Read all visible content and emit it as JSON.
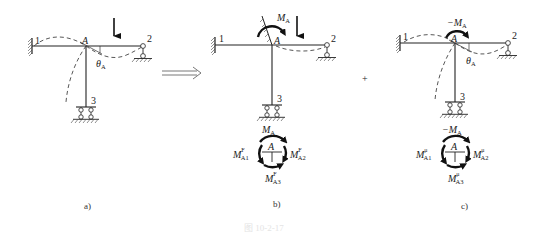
{
  "figure": {
    "caption": "图 10-2-17",
    "operators": {
      "equivalence": "⟹",
      "plus": "+"
    }
  },
  "panels": [
    {
      "id": "a",
      "label": "a)",
      "nodes": {
        "fixed_end": "1",
        "joint": "A",
        "pin_end": "2",
        "roller_end": "3"
      },
      "annotations": {
        "rotation": "θ",
        "rotation_sub": "A"
      },
      "load": "downward point load on member A-2"
    },
    {
      "id": "b",
      "label": "b)",
      "nodes": {
        "fixed_end": "1",
        "joint": "A",
        "pin_end": "2",
        "roller_end": "3"
      },
      "annotations": {
        "moment": "M",
        "moment_sub": "A"
      },
      "load": "downward point load on member A-2, joint A clamped",
      "free_body": {
        "center": "A",
        "top": {
          "sym": "M",
          "sub": "A",
          "sup": ""
        },
        "left": {
          "sym": "M",
          "sub": "A1",
          "sup": "F"
        },
        "right": {
          "sym": "M",
          "sub": "A2",
          "sup": "F"
        },
        "bottom": {
          "sym": "M",
          "sub": "A3",
          "sup": "F"
        }
      }
    },
    {
      "id": "c",
      "label": "c)",
      "nodes": {
        "fixed_end": "1",
        "joint": "A",
        "pin_end": "2",
        "roller_end": "3"
      },
      "annotations": {
        "moment": "−M",
        "moment_sub": "A",
        "rotation": "θ",
        "rotation_sub": "A"
      },
      "free_body": {
        "center": "A",
        "top": {
          "sym": "−M",
          "sub": "A",
          "sup": ""
        },
        "left": {
          "sym": "M",
          "sub": "A1",
          "sup": "μ"
        },
        "right": {
          "sym": "M",
          "sub": "A2",
          "sup": "μ"
        },
        "bottom": {
          "sym": "M",
          "sub": "A3",
          "sup": "μ"
        }
      }
    }
  ]
}
